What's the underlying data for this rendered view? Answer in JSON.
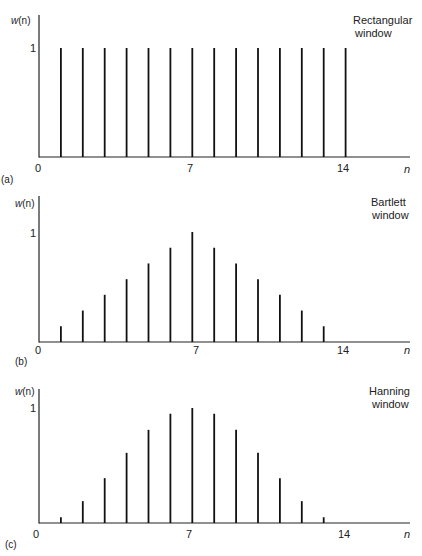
{
  "chart_data": [
    {
      "type": "bar",
      "subtype": "stem",
      "panel_label": "(a)",
      "title": [
        "Rectangular",
        "window"
      ],
      "ylabel": "w(n)",
      "xlabel": "n",
      "xticks": [
        "0",
        "7",
        "14"
      ],
      "yticks": [
        "1"
      ],
      "x": [
        1,
        2,
        3,
        4,
        5,
        6,
        7,
        8,
        9,
        10,
        11,
        12,
        13,
        14
      ],
      "values": [
        1,
        1,
        1,
        1,
        1,
        1,
        1,
        1,
        1,
        1,
        1,
        1,
        1,
        1
      ],
      "xlim": [
        0,
        17
      ],
      "ylim": [
        0,
        1.2
      ]
    },
    {
      "type": "bar",
      "subtype": "stem",
      "panel_label": "(b)",
      "title": [
        "Bartlett",
        "window"
      ],
      "ylabel": "w(n)",
      "xlabel": "n",
      "xticks": [
        "0",
        "7",
        "14"
      ],
      "yticks": [
        "1"
      ],
      "x": [
        1,
        2,
        3,
        4,
        5,
        6,
        7,
        8,
        9,
        10,
        11,
        12,
        13
      ],
      "values": [
        0.143,
        0.286,
        0.429,
        0.571,
        0.714,
        0.857,
        1.0,
        0.857,
        0.714,
        0.571,
        0.429,
        0.286,
        0.143
      ],
      "xlim": [
        0,
        17
      ],
      "ylim": [
        0,
        1.2
      ]
    },
    {
      "type": "bar",
      "subtype": "stem",
      "panel_label": "(c)",
      "title": [
        "Hanning",
        "window"
      ],
      "ylabel": "w(n)",
      "xlabel": "n",
      "xticks": [
        "0",
        "7",
        "14"
      ],
      "yticks": [
        "1"
      ],
      "x": [
        1,
        2,
        3,
        4,
        5,
        6,
        7,
        8,
        9,
        10,
        11,
        12,
        13
      ],
      "values": [
        0.05,
        0.19,
        0.39,
        0.61,
        0.81,
        0.95,
        1.0,
        0.95,
        0.81,
        0.61,
        0.39,
        0.19,
        0.05
      ],
      "xlim": [
        0,
        17
      ],
      "ylim": [
        0,
        1.1
      ]
    }
  ],
  "panels": [
    {
      "label": "(a)",
      "title1": "Rectangular",
      "title2": "window",
      "ylabel_w": "w",
      "ylabel_rest": "(n)",
      "ytick": "1",
      "x0": "0",
      "x7": "7",
      "x14": "14",
      "xname": "n"
    },
    {
      "label": "(b)",
      "title1": "Bartlett",
      "title2": "window",
      "ylabel_w": "w",
      "ylabel_rest": "(n)",
      "ytick": "1",
      "x0": "0",
      "x7": "7",
      "x14": "14",
      "xname": "n"
    },
    {
      "label": "(c)",
      "title1": "Hanning",
      "title2": "window",
      "ylabel_w": "w",
      "ylabel_rest": "(n)",
      "ytick": "1",
      "x0": "0",
      "x7": "7",
      "x14": "14",
      "xname": "n"
    }
  ],
  "colors": {
    "stem": "#111111",
    "axis": "#222222"
  }
}
